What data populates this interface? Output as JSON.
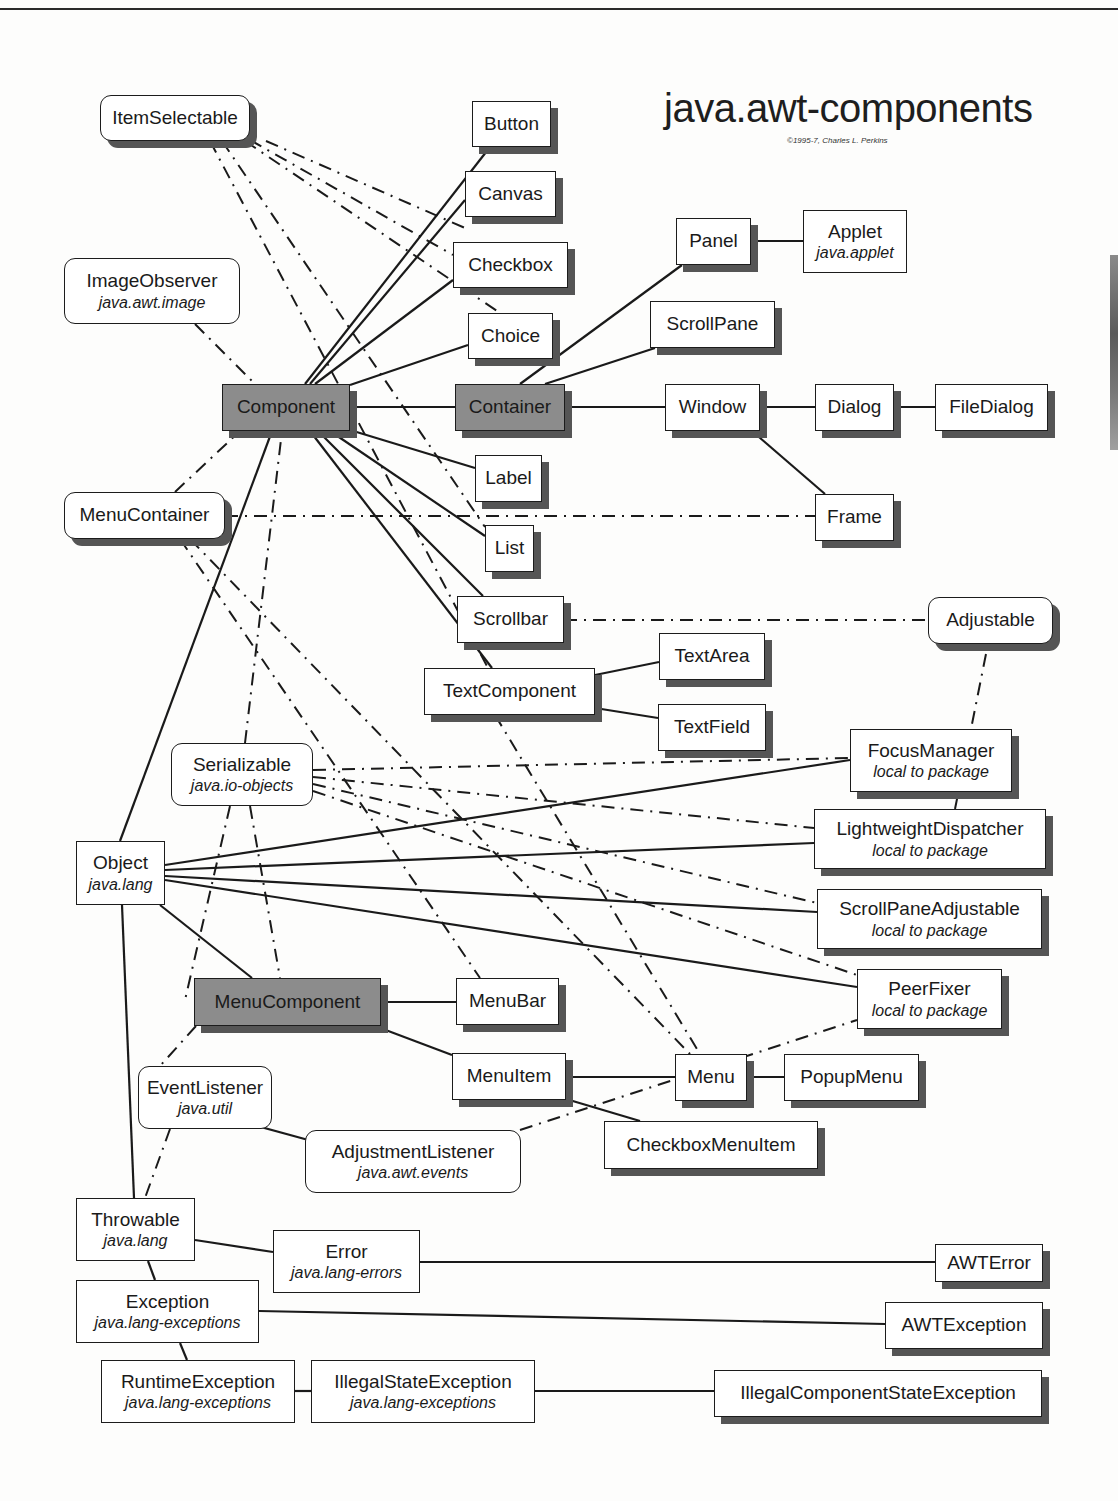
{
  "header": {
    "title": "java.awt-components",
    "copyright": "©1995-7, Charles L. Perkins"
  },
  "legend_colors": {
    "core_class_fill": "#8c8c8c",
    "class_fill": "#ffffff",
    "shadow": "#555555",
    "line": "#1a1a1a"
  },
  "nodes": [
    {
      "id": "ItemSelectable",
      "name": "ItemSelectable",
      "pkg": "",
      "type": "interface",
      "shadow": true,
      "x": 100,
      "y": 95,
      "w": 150,
      "h": 46
    },
    {
      "id": "ImageObserver",
      "name": "ImageObserver",
      "pkg": "java.awt.image",
      "type": "interface",
      "shadow": false,
      "x": 64,
      "y": 258,
      "w": 176,
      "h": 66
    },
    {
      "id": "Button",
      "name": "Button",
      "pkg": "",
      "type": "class",
      "shadow": true,
      "x": 472,
      "y": 101,
      "w": 79,
      "h": 46
    },
    {
      "id": "Canvas",
      "name": "Canvas",
      "pkg": "",
      "type": "class",
      "shadow": true,
      "x": 465,
      "y": 171,
      "w": 91,
      "h": 46
    },
    {
      "id": "Checkbox",
      "name": "Checkbox",
      "pkg": "",
      "type": "class",
      "shadow": true,
      "x": 453,
      "y": 242,
      "w": 115,
      "h": 46
    },
    {
      "id": "Choice",
      "name": "Choice",
      "pkg": "",
      "type": "class",
      "shadow": true,
      "x": 468,
      "y": 313,
      "w": 85,
      "h": 46
    },
    {
      "id": "Panel",
      "name": "Panel",
      "pkg": "",
      "type": "class",
      "shadow": true,
      "x": 676,
      "y": 218,
      "w": 75,
      "h": 47
    },
    {
      "id": "Applet",
      "name": "Applet",
      "pkg": "java.applet",
      "type": "class",
      "shadow": false,
      "x": 803,
      "y": 210,
      "w": 104,
      "h": 63
    },
    {
      "id": "ScrollPane",
      "name": "ScrollPane",
      "pkg": "",
      "type": "class",
      "shadow": true,
      "x": 650,
      "y": 301,
      "w": 125,
      "h": 47
    },
    {
      "id": "Component",
      "name": "Component",
      "pkg": "",
      "type": "core",
      "shadow": true,
      "x": 222,
      "y": 384,
      "w": 128,
      "h": 47
    },
    {
      "id": "Container",
      "name": "Container",
      "pkg": "",
      "type": "core",
      "shadow": true,
      "x": 455,
      "y": 384,
      "w": 110,
      "h": 47
    },
    {
      "id": "Window",
      "name": "Window",
      "pkg": "",
      "type": "class",
      "shadow": true,
      "x": 665,
      "y": 384,
      "w": 95,
      "h": 47
    },
    {
      "id": "Dialog",
      "name": "Dialog",
      "pkg": "",
      "type": "class",
      "shadow": true,
      "x": 815,
      "y": 384,
      "w": 79,
      "h": 47
    },
    {
      "id": "FileDialog",
      "name": "FileDialog",
      "pkg": "",
      "type": "class",
      "shadow": true,
      "x": 935,
      "y": 384,
      "w": 113,
      "h": 47
    },
    {
      "id": "Label",
      "name": "Label",
      "pkg": "",
      "type": "class",
      "shadow": true,
      "x": 475,
      "y": 455,
      "w": 67,
      "h": 47
    },
    {
      "id": "MenuContainer",
      "name": "MenuContainer",
      "pkg": "",
      "type": "interface",
      "shadow": true,
      "x": 64,
      "y": 492,
      "w": 161,
      "h": 47
    },
    {
      "id": "Frame",
      "name": "Frame",
      "pkg": "",
      "type": "class",
      "shadow": true,
      "x": 815,
      "y": 494,
      "w": 79,
      "h": 47
    },
    {
      "id": "List",
      "name": "List",
      "pkg": "",
      "type": "class",
      "shadow": true,
      "x": 485,
      "y": 525,
      "w": 49,
      "h": 47
    },
    {
      "id": "Scrollbar",
      "name": "Scrollbar",
      "pkg": "",
      "type": "class",
      "shadow": true,
      "x": 457,
      "y": 596,
      "w": 107,
      "h": 47
    },
    {
      "id": "Adjustable",
      "name": "Adjustable",
      "pkg": "",
      "type": "interface",
      "shadow": true,
      "x": 928,
      "y": 597,
      "w": 125,
      "h": 47
    },
    {
      "id": "TextArea",
      "name": "TextArea",
      "pkg": "",
      "type": "class",
      "shadow": true,
      "x": 659,
      "y": 633,
      "w": 106,
      "h": 47
    },
    {
      "id": "TextComponent",
      "name": "TextComponent",
      "pkg": "",
      "type": "class",
      "shadow": true,
      "x": 424,
      "y": 668,
      "w": 171,
      "h": 47
    },
    {
      "id": "TextField",
      "name": "TextField",
      "pkg": "",
      "type": "class",
      "shadow": true,
      "x": 658,
      "y": 704,
      "w": 108,
      "h": 47
    },
    {
      "id": "FocusManager",
      "name": "FocusManager",
      "pkg": "local to package",
      "type": "class",
      "shadow": true,
      "x": 850,
      "y": 729,
      "w": 162,
      "h": 63
    },
    {
      "id": "Serializable",
      "name": "Serializable",
      "pkg": "java.io-objects",
      "type": "interface",
      "shadow": false,
      "x": 171,
      "y": 743,
      "w": 142,
      "h": 63
    },
    {
      "id": "LightweightDispatcher",
      "name": "LightweightDispatcher",
      "pkg": "local to package",
      "type": "class",
      "shadow": true,
      "x": 814,
      "y": 809,
      "w": 232,
      "h": 60
    },
    {
      "id": "Object",
      "name": "Object",
      "pkg": "java.lang",
      "type": "class",
      "shadow": false,
      "x": 76,
      "y": 841,
      "w": 89,
      "h": 64
    },
    {
      "id": "ScrollPaneAdjustable",
      "name": "ScrollPaneAdjustable",
      "pkg": "local to package",
      "type": "class",
      "shadow": true,
      "x": 817,
      "y": 889,
      "w": 225,
      "h": 60
    },
    {
      "id": "PeerFixer",
      "name": "PeerFixer",
      "pkg": "local to package",
      "type": "class",
      "shadow": true,
      "x": 857,
      "y": 969,
      "w": 145,
      "h": 60
    },
    {
      "id": "MenuComponent",
      "name": "MenuComponent",
      "pkg": "",
      "type": "core",
      "shadow": true,
      "x": 194,
      "y": 978,
      "w": 187,
      "h": 48
    },
    {
      "id": "MenuBar",
      "name": "MenuBar",
      "pkg": "",
      "type": "class",
      "shadow": true,
      "x": 456,
      "y": 978,
      "w": 103,
      "h": 47
    },
    {
      "id": "MenuItem",
      "name": "MenuItem",
      "pkg": "",
      "type": "class",
      "shadow": true,
      "x": 452,
      "y": 1053,
      "w": 114,
      "h": 47
    },
    {
      "id": "Menu",
      "name": "Menu",
      "pkg": "",
      "type": "class",
      "shadow": true,
      "x": 675,
      "y": 1054,
      "w": 72,
      "h": 47
    },
    {
      "id": "PopupMenu",
      "name": "PopupMenu",
      "pkg": "",
      "type": "class",
      "shadow": true,
      "x": 784,
      "y": 1054,
      "w": 135,
      "h": 47
    },
    {
      "id": "EventListener",
      "name": "EventListener",
      "pkg": "java.util",
      "type": "interface",
      "shadow": false,
      "x": 138,
      "y": 1066,
      "w": 134,
      "h": 63
    },
    {
      "id": "CheckboxMenuItem",
      "name": "CheckboxMenuItem",
      "pkg": "",
      "type": "class",
      "shadow": true,
      "x": 604,
      "y": 1121,
      "w": 214,
      "h": 48
    },
    {
      "id": "AdjustmentListener",
      "name": "AdjustmentListener",
      "pkg": "java.awt.events",
      "type": "interface",
      "shadow": false,
      "x": 305,
      "y": 1130,
      "w": 216,
      "h": 63
    },
    {
      "id": "Throwable",
      "name": "Throwable",
      "pkg": "java.lang",
      "type": "class",
      "shadow": false,
      "x": 76,
      "y": 1198,
      "w": 119,
      "h": 63
    },
    {
      "id": "Error",
      "name": "Error",
      "pkg": "java.lang-errors",
      "type": "class",
      "shadow": false,
      "x": 273,
      "y": 1230,
      "w": 147,
      "h": 63
    },
    {
      "id": "AWTError",
      "name": "AWTError",
      "pkg": "",
      "type": "class",
      "shadow": true,
      "x": 935,
      "y": 1244,
      "w": 108,
      "h": 38
    },
    {
      "id": "Exception",
      "name": "Exception",
      "pkg": "java.lang-exceptions",
      "type": "class",
      "shadow": false,
      "x": 76,
      "y": 1280,
      "w": 183,
      "h": 63
    },
    {
      "id": "AWTException",
      "name": "AWTException",
      "pkg": "",
      "type": "class",
      "shadow": true,
      "x": 885,
      "y": 1302,
      "w": 158,
      "h": 47
    },
    {
      "id": "RuntimeException",
      "name": "RuntimeException",
      "pkg": "java.lang-exceptions",
      "type": "class",
      "shadow": false,
      "x": 101,
      "y": 1360,
      "w": 194,
      "h": 63
    },
    {
      "id": "IllegalStateException",
      "name": "IllegalStateException",
      "pkg": "java.lang-exceptions",
      "type": "class",
      "shadow": false,
      "x": 311,
      "y": 1360,
      "w": 224,
      "h": 63
    },
    {
      "id": "IllegalComponentStateException",
      "name": "IllegalComponentStateException",
      "pkg": "",
      "type": "class",
      "shadow": true,
      "x": 714,
      "y": 1370,
      "w": 328,
      "h": 47
    }
  ],
  "edges": [
    {
      "from": "Component",
      "to": "Button",
      "style": "solid",
      "pts": [
        305,
        384,
        490,
        147
      ]
    },
    {
      "from": "Component",
      "to": "Canvas",
      "style": "solid",
      "pts": [
        310,
        384,
        465,
        200
      ]
    },
    {
      "from": "Component",
      "to": "Checkbox",
      "style": "solid",
      "pts": [
        315,
        384,
        453,
        280
      ]
    },
    {
      "from": "Component",
      "to": "Choice",
      "style": "solid",
      "pts": [
        350,
        385,
        468,
        345
      ]
    },
    {
      "from": "Component",
      "to": "Container",
      "style": "solid",
      "pts": [
        350,
        407,
        455,
        407
      ]
    },
    {
      "from": "Component",
      "to": "Label",
      "style": "solid",
      "pts": [
        350,
        430,
        475,
        468
      ]
    },
    {
      "from": "Component",
      "to": "List",
      "style": "solid",
      "pts": [
        330,
        431,
        485,
        536
      ]
    },
    {
      "from": "Component",
      "to": "Scrollbar",
      "style": "solid",
      "pts": [
        318,
        431,
        483,
        596
      ]
    },
    {
      "from": "Component",
      "to": "TextComponent",
      "style": "solid",
      "pts": [
        310,
        431,
        492,
        668
      ]
    },
    {
      "from": "Object",
      "to": "Component",
      "style": "solid",
      "pts": [
        120,
        841,
        272,
        431
      ]
    },
    {
      "from": "Container",
      "to": "Panel",
      "style": "solid",
      "pts": [
        520,
        384,
        682,
        265
      ]
    },
    {
      "from": "Container",
      "to": "ScrollPane",
      "style": "solid",
      "pts": [
        545,
        384,
        655,
        348
      ]
    },
    {
      "from": "Container",
      "to": "Window",
      "style": "solid",
      "pts": [
        565,
        407,
        665,
        407
      ]
    },
    {
      "from": "Panel",
      "to": "Applet",
      "style": "solid",
      "pts": [
        751,
        241,
        803,
        241
      ]
    },
    {
      "from": "Window",
      "to": "Dialog",
      "style": "solid",
      "pts": [
        760,
        407,
        815,
        407
      ]
    },
    {
      "from": "Dialog",
      "to": "FileDialog",
      "style": "solid",
      "pts": [
        894,
        407,
        935,
        407
      ]
    },
    {
      "from": "Window",
      "to": "Frame",
      "style": "solid",
      "pts": [
        752,
        431,
        825,
        494
      ]
    },
    {
      "from": "TextComponent",
      "to": "TextArea",
      "style": "solid",
      "pts": [
        595,
        675,
        659,
        662
      ]
    },
    {
      "from": "TextComponent",
      "to": "TextField",
      "style": "solid",
      "pts": [
        595,
        708,
        658,
        718
      ]
    },
    {
      "from": "Object",
      "to": "FocusManager",
      "style": "solid",
      "pts": [
        165,
        865,
        850,
        760
      ]
    },
    {
      "from": "Object",
      "to": "LightweightDispatcher",
      "style": "solid",
      "pts": [
        165,
        870,
        814,
        843
      ]
    },
    {
      "from": "Object",
      "to": "ScrollPaneAdjustable",
      "style": "solid",
      "pts": [
        165,
        876,
        817,
        912
      ]
    },
    {
      "from": "Object",
      "to": "PeerFixer",
      "style": "solid",
      "pts": [
        165,
        880,
        857,
        987
      ]
    },
    {
      "from": "Object",
      "to": "MenuComponent",
      "style": "solid",
      "pts": [
        160,
        905,
        252,
        978
      ]
    },
    {
      "from": "Object",
      "to": "Throwable",
      "style": "solid",
      "pts": [
        122,
        905,
        134,
        1198
      ]
    },
    {
      "from": "MenuComponent",
      "to": "MenuBar",
      "style": "solid",
      "pts": [
        381,
        1002,
        456,
        1002
      ]
    },
    {
      "from": "MenuComponent",
      "to": "MenuItem",
      "style": "solid",
      "pts": [
        375,
        1026,
        452,
        1055
      ]
    },
    {
      "from": "MenuItem",
      "to": "Menu",
      "style": "solid",
      "pts": [
        566,
        1077,
        675,
        1077
      ]
    },
    {
      "from": "Menu",
      "to": "PopupMenu",
      "style": "solid",
      "pts": [
        747,
        1077,
        784,
        1077
      ]
    },
    {
      "from": "MenuItem",
      "to": "CheckboxMenuItem",
      "style": "solid",
      "pts": [
        566,
        1099,
        640,
        1121
      ]
    },
    {
      "from": "EventListener",
      "to": "AdjustmentListener",
      "style": "solid",
      "pts": [
        246,
        1123,
        312,
        1141
      ]
    },
    {
      "from": "Throwable",
      "to": "Error",
      "style": "solid",
      "pts": [
        195,
        1240,
        273,
        1252
      ]
    },
    {
      "from": "Throwable",
      "to": "Exception",
      "style": "solid",
      "pts": [
        148,
        1261,
        155,
        1280
      ]
    },
    {
      "from": "Error",
      "to": "AWTError",
      "style": "solid",
      "pts": [
        420,
        1262,
        935,
        1262
      ]
    },
    {
      "from": "Exception",
      "to": "AWTException",
      "style": "solid",
      "pts": [
        259,
        1311,
        885,
        1324
      ]
    },
    {
      "from": "Exception",
      "to": "RuntimeException",
      "style": "solid",
      "pts": [
        180,
        1343,
        187,
        1360
      ]
    },
    {
      "from": "RuntimeException",
      "to": "IllegalStateException",
      "style": "solid",
      "pts": [
        295,
        1391,
        311,
        1391
      ]
    },
    {
      "from": "IllegalStateException",
      "to": "IllegalComponentStateException",
      "style": "solid",
      "pts": [
        535,
        1391,
        714,
        1391
      ]
    },
    {
      "from": "ItemSelectable",
      "to": "Checkbox",
      "style": "dashdot",
      "pts": [
        250,
        140,
        453,
        255
      ]
    },
    {
      "from": "ItemSelectable",
      "to": "Choice",
      "style": "dashdot",
      "pts": [
        245,
        141,
        500,
        313
      ]
    },
    {
      "from": "ItemSelectable",
      "to": "Canvas",
      "style": "dashdot",
      "pts": [
        266,
        141,
        465,
        228
      ]
    },
    {
      "from": "ItemSelectable",
      "to": "List",
      "style": "dashdot",
      "pts": [
        222,
        141,
        485,
        527
      ]
    },
    {
      "from": "ItemSelectable",
      "to": "CheckboxMenuItem",
      "style": "dashdot",
      "pts": [
        210,
        141,
        488,
        668
      ]
    },
    {
      "from": "ImageObserver",
      "to": "Component",
      "style": "dashdot",
      "pts": [
        195,
        324,
        255,
        384
      ]
    },
    {
      "from": "MenuContainer",
      "to": "Component",
      "style": "dashdot",
      "pts": [
        175,
        492,
        240,
        431
      ]
    },
    {
      "from": "MenuContainer",
      "to": "Frame",
      "style": "dashdot",
      "pts": [
        225,
        516,
        815,
        516
      ]
    },
    {
      "from": "MenuContainer",
      "to": "MenuBar",
      "style": "dashdot",
      "pts": [
        180,
        539,
        480,
        978
      ]
    },
    {
      "from": "MenuContainer",
      "to": "Menu",
      "style": "dashdot",
      "pts": [
        190,
        539,
        690,
        1054
      ]
    },
    {
      "from": "Serializable",
      "to": "Component",
      "style": "dashdot",
      "pts": [
        245,
        743,
        282,
        431
      ]
    },
    {
      "from": "Serializable",
      "to": "FocusManager",
      "style": "dashdot",
      "pts": [
        313,
        770,
        850,
        758
      ]
    },
    {
      "from": "Serializable",
      "to": "LightweightDispatcher",
      "style": "dashdot",
      "pts": [
        313,
        777,
        814,
        828
      ]
    },
    {
      "from": "Serializable",
      "to": "ScrollPaneAdjustable",
      "style": "dashdot",
      "pts": [
        313,
        784,
        817,
        903
      ]
    },
    {
      "from": "Serializable",
      "to": "PeerFixer",
      "style": "dashdot",
      "pts": [
        313,
        791,
        857,
        975
      ]
    },
    {
      "from": "Serializable",
      "to": "MenuComponent",
      "style": "dashdot",
      "pts": [
        250,
        806,
        280,
        978
      ]
    },
    {
      "from": "Serializable",
      "to": "Throwable",
      "style": "dashdot",
      "pts": [
        230,
        806,
        185,
        1000
      ]
    },
    {
      "from": "Scrollbar",
      "to": "Adjustable",
      "style": "dashdot",
      "pts": [
        564,
        620,
        928,
        620
      ]
    },
    {
      "from": "ScrollPaneAdjustable",
      "to": "Adjustable",
      "style": "dashdot",
      "pts": [
        955,
        809,
        988,
        644
      ]
    },
    {
      "from": "TextComponent",
      "to": "Menu",
      "style": "dashdot",
      "pts": [
        495,
        715,
        700,
        1054
      ]
    },
    {
      "from": "AdjustmentListener",
      "to": "PeerFixer",
      "style": "dashdot",
      "pts": [
        520,
        1130,
        857,
        1020
      ]
    },
    {
      "from": "EventListener",
      "to": "Throwable",
      "style": "dashdot",
      "pts": [
        170,
        1129,
        145,
        1198
      ]
    },
    {
      "from": "MenuComponent",
      "to": "EventListener",
      "style": "dashdot",
      "pts": [
        196,
        1026,
        160,
        1066
      ]
    }
  ]
}
